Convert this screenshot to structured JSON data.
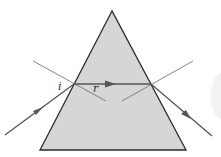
{
  "diagram": {
    "labels": {
      "incidence_angle": "i",
      "refraction_angle": "r"
    },
    "colors": {
      "prism_fill": "#d6d6d6",
      "prism_stroke": "#2a2a2a",
      "ray": "#555555",
      "normal": "#777777",
      "background": "#ffffff"
    },
    "prism": {
      "apex": [
        112,
        11
      ],
      "base_left": [
        40,
        150
      ],
      "base_right": [
        186,
        150
      ]
    },
    "rays": [
      {
        "name": "incident",
        "from": [
          5,
          135
        ],
        "to": [
          74,
          84
        ]
      },
      {
        "name": "refracted",
        "from": [
          74,
          84
        ],
        "to": [
          151,
          84
        ]
      },
      {
        "name": "emergent",
        "from": [
          151,
          84
        ],
        "to": [
          212,
          136
        ]
      }
    ],
    "normals": [
      {
        "name": "entry-normal",
        "from": [
          33,
          61
        ],
        "to": [
          106,
          101
        ]
      },
      {
        "name": "exit-normal",
        "from": [
          193,
          61
        ],
        "to": [
          122,
          101
        ]
      }
    ]
  }
}
